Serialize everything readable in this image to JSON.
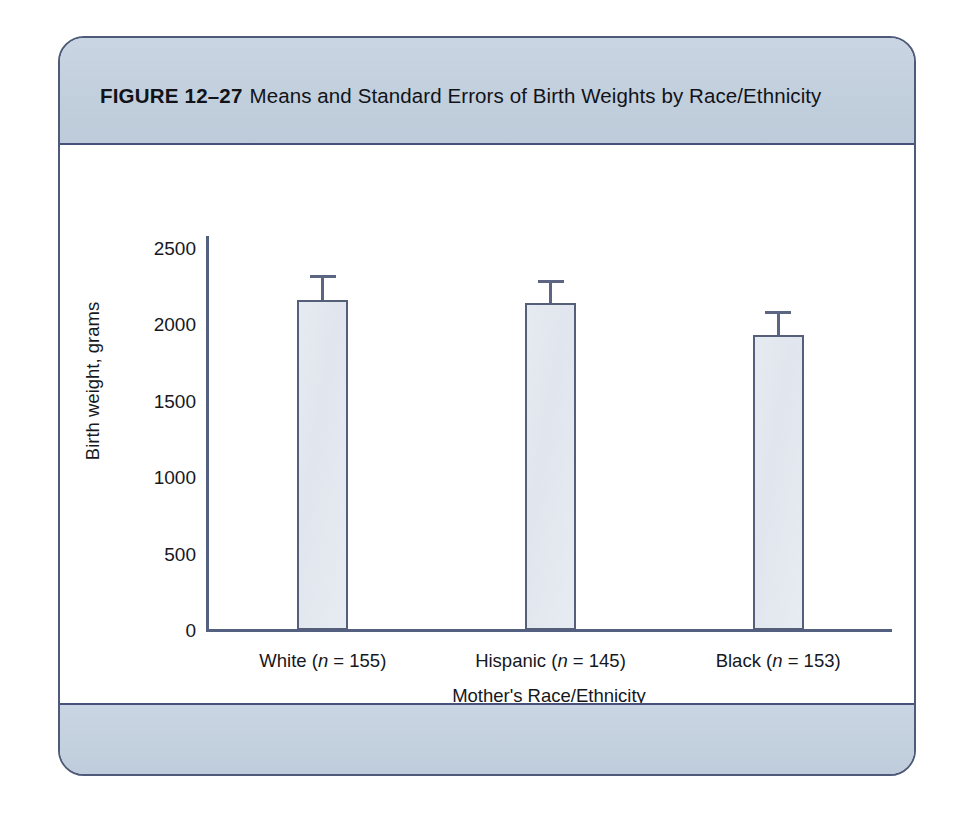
{
  "figure": {
    "label": "FIGURE 12–27",
    "title": "Means and Standard Errors of Birth Weights by Race/Ethnicity",
    "frame_border_color": "#4d5a78",
    "band_color": "#c5d2e0"
  },
  "chart_data": {
    "type": "bar",
    "title": "Means and Standard Errors of Birth Weights by Race/Ethnicity",
    "xlabel": "Mother's Race/Ethnicity",
    "ylabel": "Birth weight, grams",
    "categories": [
      "White (n = 155)",
      "Hispanic (n = 145)",
      "Black (n = 153)"
    ],
    "category_parts": [
      {
        "name": "White",
        "n_prefix": " (",
        "n_symbol": "n",
        "n_value": " = 155)"
      },
      {
        "name": "Hispanic",
        "n_prefix": " (",
        "n_symbol": "n",
        "n_value": " = 145)"
      },
      {
        "name": "Black",
        "n_prefix": " (",
        "n_symbol": "n",
        "n_value": " = 153)"
      }
    ],
    "values": [
      2160,
      2140,
      1930
    ],
    "errors": [
      145,
      130,
      140
    ],
    "error_type": "standard error",
    "ylim": [
      0,
      2500
    ],
    "yticks": [
      0,
      500,
      1000,
      1500,
      2000,
      2500
    ],
    "ytick_labels": [
      "0",
      "500",
      "1000",
      "1500",
      "2000",
      "2500"
    ],
    "grid": false,
    "legend": false,
    "bar_fill_color": "#e3e8ef",
    "bar_border_color": "#555f7a",
    "axis_color": "#54607f"
  }
}
